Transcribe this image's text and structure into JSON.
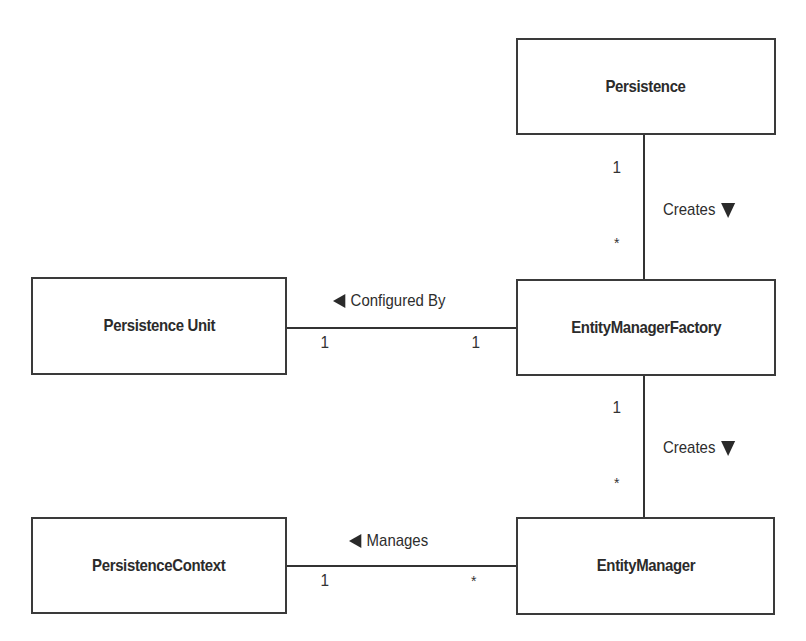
{
  "diagram": {
    "type": "UML class relationship diagram",
    "boxes": {
      "persistence": {
        "label": "Persistence"
      },
      "persistence_unit": {
        "label": "Persistence Unit"
      },
      "entity_manager_factory": {
        "label": "EntityManagerFactory"
      },
      "persistence_context": {
        "label": "PersistenceContext"
      },
      "entity_manager": {
        "label": "EntityManager"
      }
    },
    "associations": {
      "persistence_creates_emf": {
        "label": "Creates",
        "direction_icon": "triangle-down",
        "from": "Persistence",
        "to": "EntityManagerFactory",
        "source_multiplicity": "1",
        "target_multiplicity": "*"
      },
      "emf_configured_by_pu": {
        "label": "Configured By",
        "direction_icon": "triangle-left",
        "from": "EntityManagerFactory",
        "to": "Persistence Unit",
        "left_multiplicity": "1",
        "right_multiplicity": "1"
      },
      "emf_creates_em": {
        "label": "Creates",
        "direction_icon": "triangle-down",
        "from": "EntityManagerFactory",
        "to": "EntityManager",
        "source_multiplicity": "1",
        "target_multiplicity": "*"
      },
      "em_manages_pc": {
        "label": "Manages",
        "direction_icon": "triangle-left",
        "from": "EntityManager",
        "to": "PersistenceContext",
        "left_multiplicity": "1",
        "right_multiplicity": "*"
      }
    }
  }
}
